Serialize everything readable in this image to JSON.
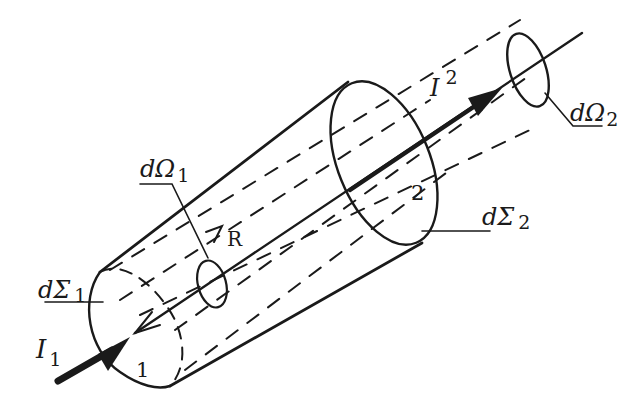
{
  "diagram": {
    "type": "optics-geometry-figure",
    "colors": {
      "ink": "#1a1a1a",
      "background": "#ffffff"
    },
    "labels": {
      "d_sigma_1": {
        "main": "dΣ",
        "sub": "1"
      },
      "d_sigma_2": {
        "main": "dΣ",
        "sub": "2"
      },
      "d_omega_1": {
        "main": "dΩ",
        "sub": "1"
      },
      "d_omega_2": {
        "main": "dΩ",
        "sub": "2"
      },
      "i_1": {
        "main": "I",
        "sub": "1"
      },
      "i_2": {
        "main": "I",
        "sub": "2"
      },
      "r": "R",
      "surface_1": "1",
      "surface_2": "2"
    }
  }
}
